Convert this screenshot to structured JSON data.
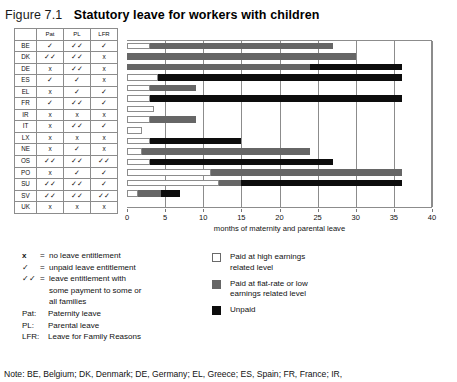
{
  "figure": {
    "number": "Figure 7.1",
    "title": "Statutory leave for workers with children"
  },
  "table": {
    "headers": [
      "",
      "Pat",
      "PL",
      "LFR"
    ],
    "rows": [
      {
        "code": "BE",
        "pat": "✓",
        "pl": "✓✓",
        "lfr": "✓"
      },
      {
        "code": "DK",
        "pat": "✓✓",
        "pl": "✓✓",
        "lfr": "x"
      },
      {
        "code": "DE",
        "pat": "x",
        "pl": "✓✓",
        "lfr": "x"
      },
      {
        "code": "ES",
        "pat": "✓",
        "pl": "✓",
        "lfr": "x"
      },
      {
        "code": "EL",
        "pat": "x",
        "pl": "✓",
        "lfr": "✓"
      },
      {
        "code": "FR",
        "pat": "✓",
        "pl": "✓✓",
        "lfr": "✓"
      },
      {
        "code": "IR",
        "pat": "x",
        "pl": "x",
        "lfr": "x"
      },
      {
        "code": "IT",
        "pat": "x",
        "pl": "✓✓",
        "lfr": "✓"
      },
      {
        "code": "LX",
        "pat": "x",
        "pl": "x",
        "lfr": "x"
      },
      {
        "code": "NE",
        "pat": "x",
        "pl": "✓",
        "lfr": "x"
      },
      {
        "code": "OS",
        "pat": "✓✓",
        "pl": "✓✓",
        "lfr": "✓✓"
      },
      {
        "code": "PO",
        "pat": "x",
        "pl": "✓",
        "lfr": "✓"
      },
      {
        "code": "SU",
        "pat": "✓✓",
        "pl": "✓✓",
        "lfr": "✓"
      },
      {
        "code": "SV",
        "pat": "✓✓",
        "pl": "✓✓",
        "lfr": "✓✓"
      },
      {
        "code": "UK",
        "pat": "x",
        "pl": "x",
        "lfr": "x"
      }
    ]
  },
  "chart_data": {
    "type": "bar",
    "orientation": "horizontal",
    "stacked": true,
    "title": "Statutory leave for workers with children",
    "xlabel": "months of maternity and parental leave",
    "ylabel": "",
    "xlim": [
      0,
      40
    ],
    "xticks": [
      0,
      5,
      10,
      15,
      20,
      25,
      30,
      35,
      40
    ],
    "xticklabels": [
      "0",
      "5",
      "10",
      "15",
      "20",
      "25",
      "30",
      "35",
      "40"
    ],
    "grid": "vertical",
    "legend_position": "below-right",
    "categories": [
      "BE",
      "DK",
      "DE",
      "ES",
      "EL",
      "FR",
      "IR",
      "IT",
      "LX",
      "NE",
      "OS",
      "PO",
      "SU",
      "SV",
      "UK"
    ],
    "series": [
      {
        "name": "Paid at high earnings related level",
        "color": "#ffffff",
        "values": [
          3,
          0,
          0,
          4,
          3,
          3,
          3.5,
          3,
          2,
          3,
          2,
          3,
          11,
          12,
          1.5
        ]
      },
      {
        "name": "Paid at flat-rate or low earnings related level",
        "color": "#666666",
        "values": [
          24,
          30,
          24,
          0,
          6,
          0,
          0,
          6,
          0,
          0,
          22,
          0,
          25,
          3,
          3
        ]
      },
      {
        "name": "Unpaid",
        "color": "#0d0d0d",
        "values": [
          0,
          0,
          12,
          32,
          0,
          33,
          0,
          0,
          0,
          12,
          0,
          24,
          0,
          21,
          2.5
        ]
      }
    ],
    "totals": [
      27,
      30,
      36,
      36,
      9,
      36,
      3.5,
      9,
      2,
      15,
      24,
      27,
      36,
      36,
      7
    ]
  },
  "symbol_key": {
    "rows": [
      {
        "sym": "x",
        "eq": "=",
        "text": "no leave entitlement"
      },
      {
        "sym": "✓",
        "eq": "=",
        "text": "unpaid leave entitlement"
      },
      {
        "sym": "✓✓",
        "eq": "=",
        "text": "leave  entitlement  with"
      }
    ],
    "cont1": "some payment to some or",
    "cont2": "all families",
    "abbrev": [
      {
        "key": "Pat:",
        "text": "Paternity leave"
      },
      {
        "key": "PL:",
        "text": "Parental leave"
      },
      {
        "key": "LFR:",
        "text": "Leave for Family Reasons"
      }
    ]
  },
  "color_key": {
    "items": [
      {
        "swatch": "high",
        "line1": "Paid at high earnings",
        "line2": "related level"
      },
      {
        "swatch": "flat",
        "line1": "Paid at flat-rate or low",
        "line2": "earnings related level"
      },
      {
        "swatch": "unpaid",
        "line1": "Unpaid",
        "line2": ""
      }
    ]
  },
  "note": {
    "text": "Note: BE, Belgium; DK, Denmark; DE, Germany; EL, Greece; ES, Spain; FR, France; IR,"
  }
}
